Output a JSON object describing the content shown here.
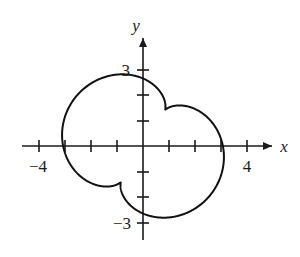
{
  "chart_data": {
    "type": "line",
    "title": "",
    "subtitle": "",
    "xlabel": "x",
    "ylabel": "y",
    "grid": false,
    "legend": null,
    "xlim": [
      -5.5,
      5.2
    ],
    "ylim": [
      -3.6,
      3.9
    ],
    "x_tick_values": [
      -4,
      -3,
      -2,
      -1,
      1,
      2,
      3,
      4
    ],
    "y_tick_values": [
      -3,
      -2,
      -1,
      1,
      2,
      3
    ],
    "x_tick_labels": [
      {
        "value": -4,
        "text": "−4"
      },
      {
        "value": 4,
        "text": "4"
      }
    ],
    "y_tick_labels": [
      {
        "value": 3,
        "text": "3"
      },
      {
        "value": -3,
        "text": "−3"
      }
    ],
    "axis_arrow_labels": {
      "x": "x",
      "y": "y"
    },
    "curve": {
      "name": "four-loop epitrochoid",
      "parametric": {
        "x": "R*cos(t) + d*cos(3*t + phase)",
        "y": "R*sin(t) + d*sin(3*t + phase)",
        "R": 2.45,
        "d": 0.78,
        "phase_degrees": 62,
        "t_range_degrees": [
          0,
          360
        ]
      },
      "loop_tip_points": [
        {
          "x": -1.25,
          "y": 3.05
        },
        {
          "x": 2.78,
          "y": 1.45
        },
        {
          "x": 1.22,
          "y": -2.95
        },
        {
          "x": -2.85,
          "y": -1.35
        }
      ],
      "waist_points": [
        {
          "x": 0.0,
          "y": 1.72
        },
        {
          "x": 1.78,
          "y": 0.0
        },
        {
          "x": 0.0,
          "y": -1.72
        },
        {
          "x": -1.78,
          "y": 0.0
        }
      ]
    }
  },
  "figure": {
    "origin_px": {
      "x": 143,
      "y": 146
    },
    "unit_px": {
      "x": 26,
      "y": 25.5
    },
    "stroke_color": "#111111",
    "axis_color": "#1a1a1a",
    "background_color": "#ffffff"
  }
}
